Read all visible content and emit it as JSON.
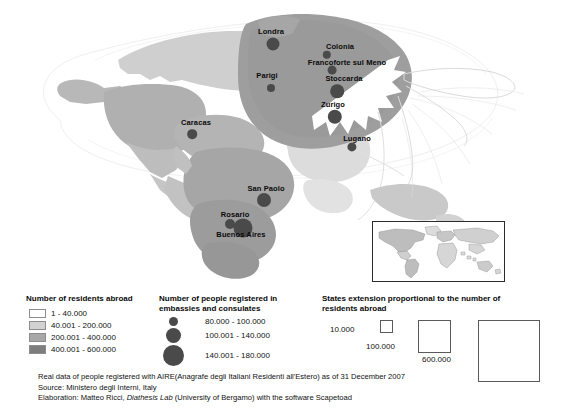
{
  "map": {
    "name": "world-cartogram-italians-abroad",
    "cities": [
      {
        "name": "Londra",
        "x": 271,
        "y": 31,
        "label_x": 271,
        "label_y": 31,
        "dot_x": 273,
        "dot_y": 44,
        "r": 6.5
      },
      {
        "name": "Colonia",
        "x": 340,
        "y": 46,
        "label_x": 340,
        "label_y": 46,
        "dot_x": 327,
        "dot_y": 55,
        "r": 4.2
      },
      {
        "name": "Francoforte sul Meno",
        "x": 347,
        "y": 62,
        "label_x": 347,
        "label_y": 62,
        "dot_x": 332,
        "dot_y": 70,
        "r": 4.4
      },
      {
        "name": "Parigi",
        "x": 267,
        "y": 75,
        "label_x": 267,
        "label_y": 75,
        "dot_x": 271,
        "dot_y": 88,
        "r": 4.0
      },
      {
        "name": "Stoccarda",
        "x": 344,
        "y": 78,
        "label_x": 344,
        "label_y": 78,
        "dot_x": 337,
        "dot_y": 91,
        "r": 6.8
      },
      {
        "name": "Zurigo",
        "x": 333,
        "y": 104,
        "label_x": 333,
        "label_y": 104,
        "dot_x": 335,
        "dot_y": 117,
        "r": 7.2
      },
      {
        "name": "Lugano",
        "x": 357,
        "y": 138,
        "label_x": 357,
        "label_y": 138,
        "dot_x": 352,
        "dot_y": 147,
        "r": 4.6
      },
      {
        "name": "Caracas",
        "x": 196,
        "y": 122,
        "label_x": 196,
        "label_y": 122,
        "dot_x": 192,
        "dot_y": 134,
        "r": 4.8
      },
      {
        "name": "San Paolo",
        "x": 266,
        "y": 188,
        "label_x": 266,
        "label_y": 188,
        "dot_x": 264,
        "dot_y": 200,
        "r": 7.0
      },
      {
        "name": "Rosario",
        "x": 235,
        "y": 214,
        "label_x": 235,
        "label_y": 214,
        "dot_x": 230,
        "dot_y": 224,
        "r": 5.0
      },
      {
        "name": "Buenos Aires",
        "x": 241,
        "y": 234,
        "label_x": 241,
        "label_y": 234,
        "dot_x": 243,
        "dot_y": 228,
        "r": 9.5
      }
    ]
  },
  "inset": {
    "name": "locator-world-map",
    "label": "world inset map"
  },
  "legend_residents": {
    "title": "Number of residents abroad",
    "items": [
      {
        "label": "1 - 40.000",
        "color": "#ffffff"
      },
      {
        "label": "40.001 - 200.000",
        "color": "#d2d2d2"
      },
      {
        "label": "200.001 - 400.000",
        "color": "#a8a8a8"
      },
      {
        "label": "400.001 - 600.000",
        "color": "#7d7d7d"
      }
    ]
  },
  "legend_embassies": {
    "title_line1": "Number of people registered in",
    "title_line2": "embassies and consulates",
    "items": [
      {
        "label": "80.000 - 100.000",
        "size": 9
      },
      {
        "label": "100.001 - 140.000",
        "size": 15
      },
      {
        "label": "140.001 - 180.000",
        "size": 21
      }
    ],
    "dot_color": "#4a4a4a"
  },
  "legend_squares": {
    "title_line1": "States extension proportional to the number of",
    "title_line2": "residents abroad",
    "items": [
      {
        "label": "10.000",
        "size": 13
      },
      {
        "label": "100.000",
        "size": 33
      },
      {
        "label": "600.000",
        "size": 62
      }
    ]
  },
  "caption": {
    "line1": "Real data of people registered with AIRE(Anagrafe degli Italiani Residenti all'Estero) as of 31 December 2007",
    "line2": "Source: Ministero degli Interni, Italy",
    "line3_pre": "Elaboration: Matteo Ricci, ",
    "line3_italic": "Diathesis Lab",
    "line3_post": " (University of Bergamo) with the software Scapetoad"
  },
  "colors": {
    "land_light": "#d2d2d2",
    "land_mid": "#a8a8a8",
    "land_dark": "#8e8e8e",
    "outline": "#9a9a9a",
    "marker": "#4a4a4a"
  }
}
